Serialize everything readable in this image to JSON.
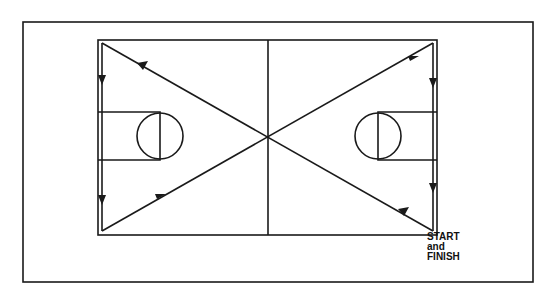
{
  "diagram": {
    "start_label": [
      "START",
      "and",
      "FINISH"
    ],
    "line_color": "#1a1a1a",
    "background": "#ffffff"
  }
}
